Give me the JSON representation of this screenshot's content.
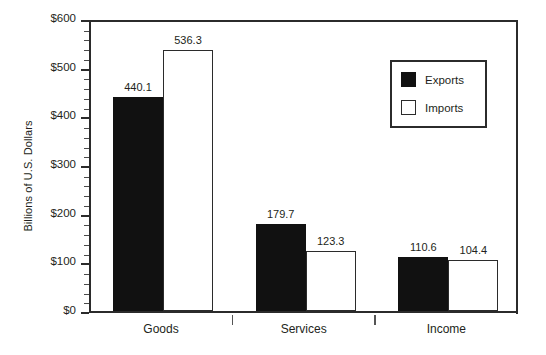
{
  "chart_data": {
    "type": "bar",
    "title": "",
    "xlabel": "",
    "ylabel": "Billions of U.S. Dollars",
    "categories": [
      "Goods",
      "Services",
      "Income"
    ],
    "series": [
      {
        "name": "Exports",
        "values": [
          440.1,
          536.3,
          179.7
        ],
        "color": "#111111"
      },
      {
        "name": "Imports",
        "values": [
          123.3,
          110.6,
          104.4
        ],
        "color": "#ffffff"
      }
    ],
    "ylim": [
      0,
      600
    ],
    "yticks": [
      0,
      100,
      200,
      300,
      400,
      500,
      600
    ],
    "ytick_labels": [
      "$0",
      "$100",
      "$200",
      "$300",
      "$400",
      "$500",
      "$600"
    ],
    "minor_tick_step": 20,
    "grid": false,
    "legend_position": "upper right",
    "groups": [
      {
        "category": "Goods",
        "bars": [
          {
            "series": "Exports",
            "value": 440.1,
            "label": "440.1"
          },
          {
            "series": "Imports",
            "value": 536.3,
            "label": "536.3"
          }
        ]
      },
      {
        "category": "Services",
        "bars": [
          {
            "series": "Exports",
            "value": 179.7,
            "label": "179.7"
          },
          {
            "series": "Imports",
            "value": 123.3,
            "label": "123.3"
          }
        ]
      },
      {
        "category": "Income",
        "bars": [
          {
            "series": "Exports",
            "value": 110.6,
            "label": "110.6"
          },
          {
            "series": "Imports",
            "value": 104.4,
            "label": "104.4"
          }
        ]
      }
    ]
  },
  "legend": {
    "entries": [
      {
        "label": "Exports",
        "swatch": "filled-black-square"
      },
      {
        "label": "Imports",
        "swatch": "open-white-square"
      }
    ]
  }
}
